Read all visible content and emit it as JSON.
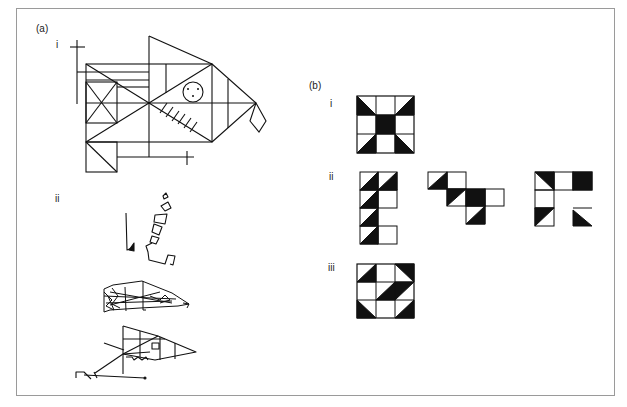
{
  "figure": {
    "panel_a": {
      "label": "(a)",
      "sub_i_label": "i",
      "sub_i_description": "Rey-Osterrieth complex figure (original model)",
      "sub_ii_label": "ii",
      "sub_ii_description": "Three patient copies of the complex figure: fragmented pieces, cluttered overlapping copy, simplified distorted copy"
    },
    "panel_b": {
      "label": "(b)",
      "sub_i_label": "i",
      "sub_i_description": "Block design model 3x3",
      "sub_i_grid": [
        [
          "lower-left",
          "white",
          "lower-right"
        ],
        [
          "white",
          "black",
          "white"
        ],
        [
          "lower-right",
          "white",
          "lower-left"
        ]
      ],
      "sub_ii_label": "ii",
      "sub_ii_description": "Three incorrect block design attempts",
      "sub_iii_label": "iii",
      "sub_iii_description": "Block design 3x3",
      "sub_iii_grid": [
        [
          "lower-right",
          "white",
          "upper-right"
        ],
        [
          "white",
          "lower-right",
          "upper-left"
        ],
        [
          "lower-left",
          "white",
          "lower-right"
        ]
      ]
    },
    "colors": {
      "ink": "#111111",
      "frame": "#9a9a9a",
      "background": "#ffffff"
    }
  }
}
